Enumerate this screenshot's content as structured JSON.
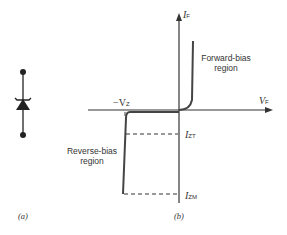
{
  "figure_a": {
    "caption": "(a)",
    "symbol": "zener-diode-icon"
  },
  "figure_b": {
    "caption": "(b)",
    "axes": {
      "y_label_main": "I",
      "y_label_sub": "F",
      "x_label_main": "V",
      "x_label_sub": "F"
    },
    "annotations": {
      "neg_vz_prefix": "−V",
      "neg_vz_sub": "Z",
      "izt_main": "I",
      "izt_sub": "ZT",
      "izm_main": "I",
      "izm_sub": "ZM",
      "forward_line1": "Forward-bias",
      "forward_line2": "region",
      "reverse_line1": "Reverse-bias",
      "reverse_line2": "region"
    }
  },
  "colors": {
    "stroke": "#333333",
    "curve": "#444444",
    "background": "#ffffff"
  }
}
